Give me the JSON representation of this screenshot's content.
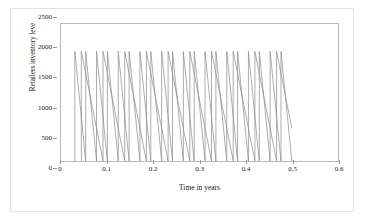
{
  "chart_data": {
    "type": "line",
    "title": "",
    "xlabel": "Time in years",
    "ylabel": "Retailers inventory leve",
    "xlim": [
      0,
      0.6
    ],
    "ylim": [
      0,
      2500
    ],
    "xticks": [
      "0",
      "0.1",
      "0.2",
      "0.3",
      "0.4",
      "0.5",
      "0.6"
    ],
    "xtick_values": [
      0,
      0.1,
      0.2,
      0.3,
      0.4,
      0.5,
      0.6
    ],
    "yticks": [
      "0",
      "500",
      "1000",
      "1500",
      "2000",
      "2500"
    ],
    "ytick_values": [
      0,
      500,
      1000,
      1500,
      2000,
      2500
    ],
    "grid": false,
    "legend": "none",
    "line_color": "#808080",
    "series": [
      {
        "name": "retailer-inventory-fast-cycle",
        "description": "Sawtooth inventory: instant replenishment to 2000, linear depletion to 0, period 0.0235 years",
        "color": "#8a8a8a",
        "peak": 2000,
        "trough": 0,
        "start_x": 0.03,
        "end_x": 0.5,
        "period": 0.0235,
        "cycles": 20
      },
      {
        "name": "retailer-inventory-slow-cycle",
        "description": "Sawtooth inventory: replenishment to 2000, slower linear depletion to 0, period 0.047 years, offset half cycle",
        "color": "#8a8a8a",
        "peak": 2000,
        "trough": 0,
        "start_x": 0.044,
        "end_x": 0.5,
        "period": 0.047,
        "cycles": 10
      }
    ]
  }
}
